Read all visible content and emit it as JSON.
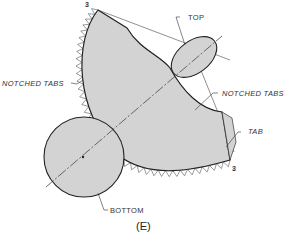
{
  "figure": {
    "caption": "(E)",
    "fill_color": "#d3d3d3",
    "stroke_color": "#222222",
    "labels": {
      "top": "TOP",
      "bottom": "BOTTOM",
      "notched_tabs_left": "NOTCHED TABS",
      "notched_tabs_right": "NOTCHED TABS",
      "tab": "TAB",
      "seam_start": "3",
      "seam_end": "3"
    }
  }
}
